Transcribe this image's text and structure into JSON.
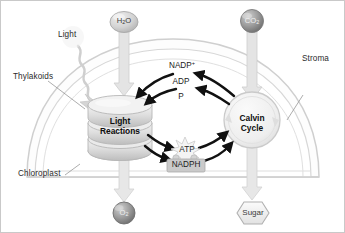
{
  "diagram": {
    "type": "biology-process-diagram"
  },
  "annotations": {
    "light": "Light",
    "thylakoids": "Thylakoids",
    "chloroplast": "Chloroplast",
    "stroma": "Stroma"
  },
  "inputs": {
    "water": {
      "formula": "H",
      "sub": "2",
      "tail": "O",
      "shape": "oval"
    },
    "carbon_dioxide": {
      "formula": "CO",
      "sub": "2",
      "shape": "circle"
    }
  },
  "outputs": {
    "oxygen": {
      "formula": "O",
      "sub": "2",
      "shape": "circle"
    },
    "sugar": {
      "label": "Sugar",
      "shape": "hexagon"
    }
  },
  "stages": {
    "light_reactions": {
      "line1": "Light",
      "line2": "Reactions",
      "shape": "granum-stack"
    },
    "calvin_cycle": {
      "line1": "Calvin",
      "line2": "Cycle",
      "shape": "circle"
    }
  },
  "intermediates": {
    "nadp_plus": {
      "base": "NADP",
      "charge": "+"
    },
    "adp": "ADP",
    "phosphate": "P",
    "atp": {
      "label": "ATP",
      "shape": "starburst"
    },
    "nadph": {
      "label": "NADPH",
      "shape": "rounded-rect"
    }
  },
  "colors": {
    "outline": "#cfcfcf",
    "membrane": "#d9d9d9",
    "arrow_pale": "#d8d8d8",
    "arrow_dark": "#111111",
    "granum_fill": "#e3e3e3",
    "circle_fill": "#f0f0f0",
    "co2_fill": "#9a9a9a",
    "o2_fill": "#8f8f8f",
    "h2o_fill": "#d2d2d2",
    "nadph_fill": "#c9c9c9",
    "text": "#1d1d1d",
    "background": "#ffffff"
  },
  "flows": [
    {
      "from": "water",
      "to": "light_reactions",
      "style": "pale-thick"
    },
    {
      "from": "light",
      "to": "light_reactions",
      "style": "wavy-bolt"
    },
    {
      "from": "light_reactions",
      "to": "oxygen",
      "style": "pale-thick"
    },
    {
      "from": "carbon_dioxide",
      "to": "calvin_cycle",
      "style": "pale-thick"
    },
    {
      "from": "calvin_cycle",
      "to": "sugar",
      "style": "pale-thick"
    },
    {
      "from": "calvin_cycle",
      "to": "nadp_plus",
      "style": "dark-curved"
    },
    {
      "from": "nadp_plus",
      "to": "light_reactions",
      "style": "dark-curved"
    },
    {
      "from": "calvin_cycle",
      "to": "adp",
      "style": "dark-curved"
    },
    {
      "from": "adp",
      "to": "light_reactions",
      "style": "dark-curved"
    },
    {
      "from": "light_reactions",
      "to": "atp",
      "style": "dark-curved"
    },
    {
      "from": "atp",
      "to": "calvin_cycle",
      "style": "dark-curved"
    },
    {
      "from": "light_reactions",
      "to": "nadph",
      "style": "dark-curved"
    },
    {
      "from": "nadph",
      "to": "calvin_cycle",
      "style": "dark-curved"
    }
  ]
}
